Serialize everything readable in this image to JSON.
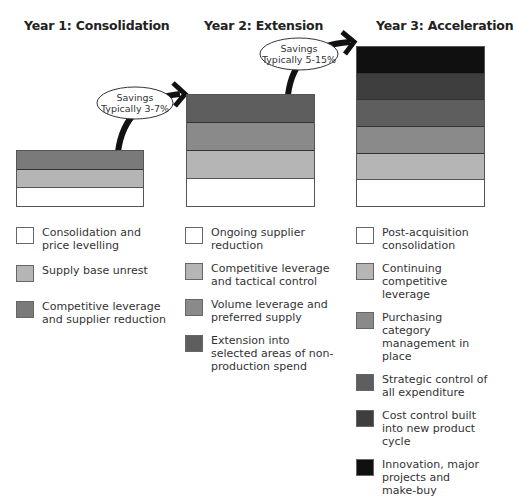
{
  "headings": [
    "Year 1:  Consolidation",
    "Year 2:  Extension",
    "Year 3:  Acceleration"
  ],
  "savings": [
    {
      "line1": "Savings",
      "line2": "Typically 3-7%"
    },
    {
      "line1": "Savings",
      "line2": "Typically 5-15%"
    }
  ],
  "colors": {
    "white": "#ffffff",
    "light_grey": "#b5b5b5",
    "mid_grey": "#8a8a8a",
    "dark_grey": "#5e5e5e",
    "darker_grey": "#3e3e3e",
    "black": "#101010"
  },
  "years": [
    {
      "legend": [
        {
          "label": "Consolidation and price levelling",
          "color": "#ffffff"
        },
        {
          "label": "Supply base unrest",
          "color": "#b5b5b5"
        },
        {
          "label": "Competitive leverage and supplier reduction",
          "color": "#7a7a7a"
        }
      ]
    },
    {
      "legend": [
        {
          "label": "Ongoing supplier reduction",
          "color": "#ffffff"
        },
        {
          "label": "Competitive leverage and tactical control",
          "color": "#b5b5b5"
        },
        {
          "label": "Volume leverage and preferred supply",
          "color": "#8a8a8a"
        },
        {
          "label": "Extension into selected areas of non-production spend",
          "color": "#5e5e5e"
        }
      ]
    },
    {
      "legend": [
        {
          "label": "Post-acquisition consolidation",
          "color": "#ffffff"
        },
        {
          "label": "Continuing competitive leverage",
          "color": "#b5b5b5"
        },
        {
          "label": "Purchasing category management in place",
          "color": "#8a8a8a"
        },
        {
          "label": "Strategic control of all expenditure",
          "color": "#5e5e5e"
        },
        {
          "label": "Cost control built into new product cycle",
          "color": "#3e3e3e"
        },
        {
          "label": "Innovation, major projects and make-buy",
          "color": "#101010"
        }
      ]
    }
  ]
}
